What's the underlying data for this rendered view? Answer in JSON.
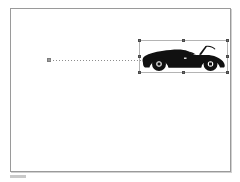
{
  "app": {
    "title": "Slide Canvas",
    "background_color": "#ffffff"
  },
  "canvas": {
    "name": "slide-canvas",
    "border_color": "#9a9a9a",
    "fill_color": "#ffffff",
    "width_px": 221,
    "height_px": 164
  },
  "motion_path": {
    "label": "",
    "style": "dotted",
    "color": "#8d8d8d",
    "start_marker_color": "#9b9b9b",
    "start_x": 36,
    "end_x": 154,
    "y": 51
  },
  "selection": {
    "label": "",
    "border_color": "#b4b4b4",
    "handle_color": "#6f6f6f",
    "x": 128,
    "y": 31,
    "width": 89,
    "height": 33,
    "handles": [
      "nw-resize-handle",
      "n-resize-handle",
      "ne-resize-handle",
      "w-resize-handle",
      "e-resize-handle",
      "sw-resize-handle",
      "s-resize-handle",
      "se-resize-handle"
    ]
  },
  "objects": [
    {
      "name": "car-clipart",
      "type": "image",
      "alt": "black convertible car silhouette",
      "fill_color": "#111111",
      "x": 129,
      "y": 32,
      "width": 87,
      "height": 31
    }
  ],
  "status_strip": {
    "label": "",
    "color": "#c9c9c9"
  }
}
